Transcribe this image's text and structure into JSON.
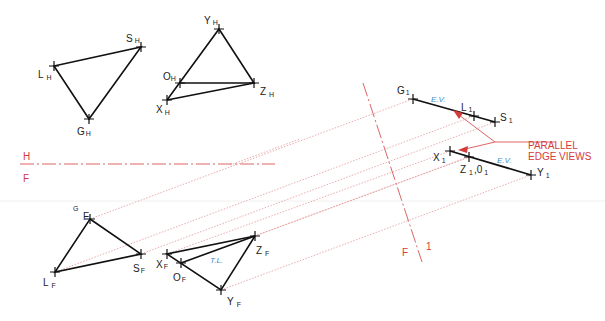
{
  "colors": {
    "object_line": "#111111",
    "projection_line": "#e08a8a",
    "fold_line": "#d43c3c",
    "annotation": "#d43c3c",
    "true_length_label": "#3a8cc8"
  },
  "fold_lines": {
    "horizontal": {
      "upper_label": "H",
      "lower_label": "F"
    },
    "auxiliary": {
      "left_label": "F",
      "right_label": "1"
    }
  },
  "views": {
    "horizontal": {
      "triangle_LSG": {
        "L": {
          "label": "L",
          "sub": "H"
        },
        "S": {
          "label": "S",
          "sub": "H"
        },
        "G": {
          "label": "G",
          "sub": "H"
        }
      },
      "plane_XYZO": {
        "Y": {
          "label": "Y",
          "sub": "H"
        },
        "O": {
          "label": "O",
          "sub": "H"
        },
        "Z": {
          "label": "Z",
          "sub": "H"
        },
        "X": {
          "label": "X",
          "sub": "H"
        }
      }
    },
    "front": {
      "triangle_LSG": {
        "G": {
          "label": "F",
          "sup": "G"
        },
        "S": {
          "label": "S",
          "sub": "F"
        },
        "L": {
          "label": "L",
          "sub": "F"
        }
      },
      "plane_XYZO": {
        "X": {
          "label": "X",
          "sub": "F"
        },
        "O": {
          "label": "O",
          "sub": "F"
        },
        "Z": {
          "label": "Z",
          "sub": "F"
        },
        "Y": {
          "label": "Y",
          "sub": "F"
        },
        "tl_label": "T.L."
      }
    },
    "auxiliary": {
      "edge_LSG": {
        "G": {
          "label": "G",
          "sub": "1"
        },
        "L": {
          "label": "L",
          "sub": "1"
        },
        "S": {
          "label": "S",
          "sub": "1"
        },
        "ev_label": "E.V."
      },
      "edge_XYZO": {
        "X": {
          "label": "X",
          "sub": "1"
        },
        "Z": {
          "label": "Z",
          "sub": "1"
        },
        "O": {
          "label": ",0",
          "sub": "1"
        },
        "Y": {
          "label": "Y",
          "sub": "1"
        },
        "ev_label": "E.V."
      }
    }
  },
  "annotation": {
    "line1": "PARALLEL",
    "line2": "EDGE VIEWS"
  }
}
